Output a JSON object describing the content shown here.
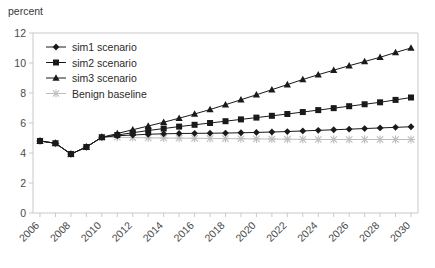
{
  "chart_data": {
    "type": "line",
    "title": "",
    "subtitle": "",
    "ylabel": "percent",
    "xlabel": "",
    "ylim": [
      0,
      12
    ],
    "yticks": [
      0,
      2,
      4,
      6,
      8,
      10,
      12
    ],
    "xlim": [
      2006,
      2030
    ],
    "x": [
      2006,
      2007,
      2008,
      2009,
      2010,
      2011,
      2012,
      2013,
      2014,
      2015,
      2016,
      2017,
      2018,
      2019,
      2020,
      2021,
      2022,
      2023,
      2024,
      2025,
      2026,
      2027,
      2028,
      2029,
      2030
    ],
    "xticks": [
      2006,
      2007,
      2008,
      2009,
      2010,
      2011,
      2012,
      2013,
      2014,
      2015,
      2016,
      2017,
      2018,
      2019,
      2020,
      2021,
      2022,
      2023,
      2024,
      2025,
      2026,
      2027,
      2028,
      2029,
      2030
    ],
    "xtick_labels": [
      "2006",
      "",
      "2008",
      "",
      "2010",
      "",
      "2012",
      "",
      "2014",
      "",
      "2016",
      "",
      "2018",
      "",
      "2020",
      "",
      "2022",
      "",
      "2024",
      "",
      "2026",
      "",
      "2028",
      "",
      "2030"
    ],
    "xtick_label_rotation": -45,
    "grid": false,
    "legend_position": "top-left",
    "series": [
      {
        "name": "sim1 scenario",
        "marker": "diamond",
        "color": "#1a1a1a",
        "values": [
          4.8,
          4.65,
          3.93,
          4.4,
          5.05,
          5.15,
          5.2,
          5.25,
          5.28,
          5.3,
          5.31,
          5.32,
          5.33,
          5.35,
          5.37,
          5.4,
          5.43,
          5.47,
          5.51,
          5.55,
          5.59,
          5.63,
          5.67,
          5.71,
          5.75
        ]
      },
      {
        "name": "sim2 scenario",
        "marker": "square",
        "color": "#1a1a1a",
        "values": [
          4.8,
          4.65,
          3.93,
          4.4,
          5.05,
          5.2,
          5.35,
          5.5,
          5.63,
          5.76,
          5.88,
          6.0,
          6.12,
          6.24,
          6.36,
          6.48,
          6.6,
          6.73,
          6.86,
          6.99,
          7.12,
          7.25,
          7.38,
          7.54,
          7.7
        ]
      },
      {
        "name": "sim3 scenario",
        "marker": "triangle",
        "color": "#1a1a1a",
        "values": [
          4.8,
          4.65,
          3.93,
          4.4,
          5.05,
          5.3,
          5.55,
          5.8,
          6.05,
          6.32,
          6.6,
          6.9,
          7.22,
          7.55,
          7.88,
          8.22,
          8.56,
          8.9,
          9.22,
          9.52,
          9.82,
          10.1,
          10.38,
          10.7,
          11.0
        ]
      },
      {
        "name": "Benign baseline",
        "marker": "asterisk",
        "color": "#bdbdbd",
        "values": [
          4.8,
          4.65,
          3.93,
          4.4,
          5.05,
          5.05,
          5.03,
          5.01,
          5.0,
          4.99,
          4.98,
          4.97,
          4.96,
          4.95,
          4.94,
          4.93,
          4.92,
          4.91,
          4.9,
          4.9,
          4.9,
          4.9,
          4.9,
          4.9,
          4.9
        ]
      }
    ],
    "axis_color": "#c9c9c9",
    "background": "#ffffff"
  }
}
